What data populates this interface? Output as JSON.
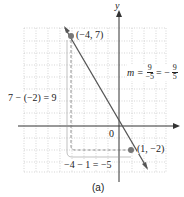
{
  "figure": {
    "caption": "(a)",
    "axes": {
      "x_label": "x",
      "y_label": "y",
      "origin_label": "0"
    },
    "grid": {
      "x_range": [
        -8,
        4
      ],
      "y_range": [
        -4,
        8
      ]
    },
    "points": [
      {
        "label": "(−4, 7)",
        "x": -4,
        "y": 7
      },
      {
        "label": "(1, −2)",
        "x": 1,
        "y": -2
      }
    ],
    "rise_label": "7 − (−2) = 9",
    "run_label": "−4 − 1 = −5",
    "slope": {
      "prefix": "m =",
      "num1": "9",
      "den1": "−5",
      "eq": "= −",
      "num2": "9",
      "den2": "5"
    },
    "colors": {
      "line": "#555555",
      "point": "#777777",
      "grid": "#bbbbbb",
      "axis": "#333333"
    }
  }
}
